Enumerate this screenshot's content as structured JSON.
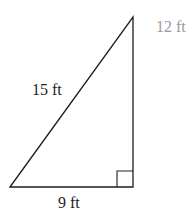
{
  "diagram": {
    "type": "right-triangle",
    "labels": {
      "hypotenuse": "15 ft",
      "base": "9 ft",
      "height": "12 ft"
    },
    "colors": {
      "stroke": "#1e1e1e",
      "height_label": "#9a9a9a"
    }
  }
}
